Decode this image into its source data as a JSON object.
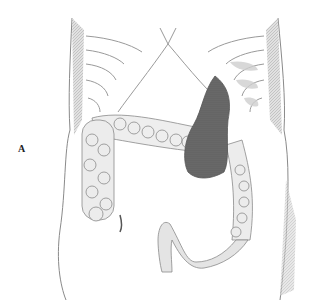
{
  "figure": {
    "label": "A",
    "colors": {
      "background": "#ffffff",
      "line": "#8a8a8a",
      "shade_dark": "#5a5a5a",
      "shade_light": "#d4d4d4"
    }
  }
}
